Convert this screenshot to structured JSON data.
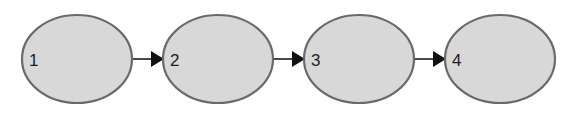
{
  "diagram": {
    "type": "linear-flow",
    "colors": {
      "node_fill": "#d8d8d8",
      "node_stroke": "#6a6a6a",
      "arrow": "#111111",
      "text": "#1e1e1e"
    },
    "nodes": [
      {
        "id": "n1",
        "label": "1"
      },
      {
        "id": "n2",
        "label": "2"
      },
      {
        "id": "n3",
        "label": "3"
      },
      {
        "id": "n4",
        "label": "4"
      }
    ],
    "edges": [
      {
        "from": "n1",
        "to": "n2"
      },
      {
        "from": "n2",
        "to": "n3"
      },
      {
        "from": "n3",
        "to": "n4"
      }
    ]
  }
}
